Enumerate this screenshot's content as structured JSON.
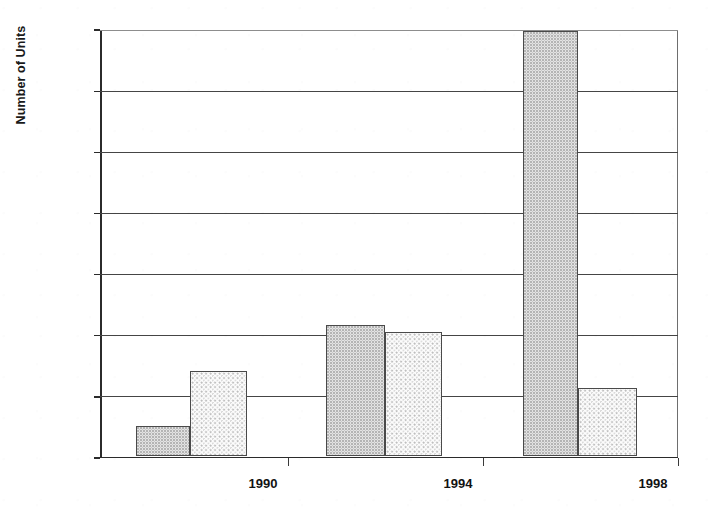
{
  "chart_data": {
    "type": "bar",
    "title": "",
    "xlabel": "",
    "ylabel": "Number of Units",
    "categories": [
      "1990",
      "1994",
      "1998"
    ],
    "series": [
      {
        "name": "series-1",
        "values": [
          50,
          215,
          695
        ]
      },
      {
        "name": "series-2",
        "values": [
          140,
          203,
          112
        ]
      }
    ],
    "ylim": [
      0,
      700
    ],
    "ytick_labels": [
      "0",
      "100",
      "200",
      "300",
      "400",
      "500",
      "600",
      "700"
    ],
    "ytick_values": [
      0,
      100,
      200,
      300,
      400,
      500,
      600,
      700
    ],
    "grid": "horizontal",
    "legend": "none",
    "bar_fill": "stipple-dot-pattern",
    "bar_edge_color": "#4a4a4a",
    "axis_color": "#2b2b2b",
    "background_color": "#ffffff"
  }
}
